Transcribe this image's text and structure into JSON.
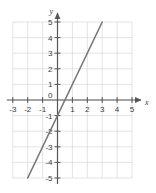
{
  "chart_data": {
    "type": "line",
    "title": "",
    "xlabel": "x",
    "ylabel": "y",
    "xlim": [
      -3,
      5
    ],
    "ylim": [
      -5,
      5
    ],
    "xticks": [
      -3,
      -2,
      -1,
      0,
      1,
      2,
      3,
      4,
      5
    ],
    "yticks": [
      -5,
      -4,
      -3,
      -2,
      -1,
      0,
      1,
      2,
      3,
      4,
      5
    ],
    "xtick_labels": [
      "-3",
      "-2",
      "-1",
      "0",
      "1",
      "2",
      "3",
      "4",
      "5"
    ],
    "ytick_labels": [
      "-5",
      "-4",
      "-3",
      "-2",
      "-1",
      "0",
      "1",
      "2",
      "3",
      "4",
      "5"
    ],
    "grid": true,
    "legend": false,
    "series": [
      {
        "name": "line",
        "equation": "y = 2x - 1",
        "slope": 2,
        "intercept": -1,
        "x": [
          -2,
          3
        ],
        "values": [
          -5,
          5
        ],
        "color": "#777777"
      }
    ],
    "colors": {
      "grid": "#d8d8d8",
      "axis": "#555555",
      "line": "#777777",
      "text": "#3a3a3a",
      "background": "#ffffff"
    }
  },
  "axes": {
    "x_name": "x",
    "y_name": "y",
    "origin_label": "0"
  },
  "ticks": {
    "x": [
      {
        "value": -3,
        "label": "-3"
      },
      {
        "value": -2,
        "label": "-2"
      },
      {
        "value": -1,
        "label": "-1"
      },
      {
        "value": 1,
        "label": "1"
      },
      {
        "value": 2,
        "label": "2"
      },
      {
        "value": 3,
        "label": "3"
      },
      {
        "value": 4,
        "label": "4"
      },
      {
        "value": 5,
        "label": "5"
      }
    ],
    "y": [
      {
        "value": 5,
        "label": "5"
      },
      {
        "value": 4,
        "label": "4"
      },
      {
        "value": 3,
        "label": "3"
      },
      {
        "value": 2,
        "label": "2"
      },
      {
        "value": 1,
        "label": "1"
      },
      {
        "value": -1,
        "label": "-1"
      },
      {
        "value": -2,
        "label": "-2"
      },
      {
        "value": -3,
        "label": "-3"
      },
      {
        "value": -4,
        "label": "-4"
      },
      {
        "value": -5,
        "label": "-5"
      }
    ]
  }
}
